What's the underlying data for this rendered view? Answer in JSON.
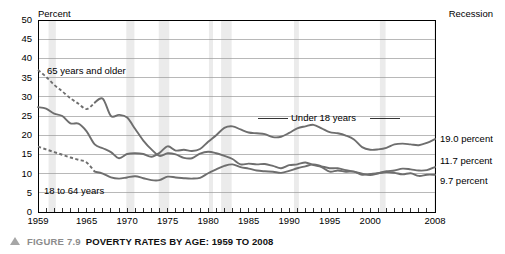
{
  "figure": {
    "caption_prefix": "FIGURE 7.9",
    "caption_title": "POVERTY RATES BY AGE: 1959 TO 2008",
    "triangle_icon": "triangle-up-icon"
  },
  "axis": {
    "y_unit_label": "Percent",
    "recession_legend": "Recession",
    "y_ticks": [
      "50",
      "45",
      "40",
      "35",
      "30",
      "25",
      "20",
      "15",
      "10",
      "5",
      "0"
    ],
    "x_ticks": [
      "1959",
      "1965",
      "1970",
      "1975",
      "1980",
      "1985",
      "1990",
      "1995",
      "2000",
      "2008"
    ]
  },
  "series_labels": {
    "under18": "Under 18 years",
    "adults": "18 to 64 years",
    "seniors": "65 years and older"
  },
  "end_labels": {
    "under18": "19.0 percent",
    "adults": "11.7 percent",
    "seniors": "9.7 percent"
  },
  "colors": {
    "line": "#6e6e6e",
    "grid": "#9a9a9a",
    "frame": "#000000",
    "recession_band": "#ebebeb",
    "caption_grey": "#8c8c8c",
    "background": "#ffffff"
  },
  "chart_data": {
    "type": "line",
    "title": "POVERTY RATES BY AGE: 1959 TO 2008",
    "xlabel": "",
    "ylabel": "Percent",
    "xlim": [
      1959,
      2008
    ],
    "ylim": [
      0,
      50
    ],
    "y_tick_step": 5,
    "grid": "horizontal",
    "legend": "inline-annotations",
    "x": [
      1959,
      1960,
      1961,
      1962,
      1963,
      1964,
      1965,
      1966,
      1967,
      1968,
      1969,
      1970,
      1971,
      1972,
      1973,
      1974,
      1975,
      1976,
      1977,
      1978,
      1979,
      1980,
      1981,
      1982,
      1983,
      1984,
      1985,
      1986,
      1987,
      1988,
      1989,
      1990,
      1991,
      1992,
      1993,
      1994,
      1995,
      1996,
      1997,
      1998,
      1999,
      2000,
      2001,
      2002,
      2003,
      2004,
      2005,
      2006,
      2007,
      2008
    ],
    "series": [
      {
        "name": "Under 18 years",
        "end_value": 19.0,
        "dashed_until": null,
        "values": [
          27.3,
          26.9,
          25.6,
          25.0,
          23.1,
          23.0,
          21.0,
          17.6,
          16.6,
          15.6,
          14.0,
          15.1,
          15.3,
          15.1,
          14.4,
          15.4,
          17.1,
          16.0,
          16.2,
          15.9,
          16.4,
          18.3,
          20.0,
          21.9,
          22.3,
          21.5,
          20.7,
          20.5,
          20.3,
          19.5,
          19.6,
          20.6,
          21.8,
          22.3,
          22.7,
          21.8,
          20.8,
          20.5,
          19.9,
          18.9,
          16.9,
          16.2,
          16.3,
          16.7,
          17.6,
          17.8,
          17.6,
          17.4,
          18.0,
          19.0
        ]
      },
      {
        "name": "18 to 64 years",
        "end_value": 11.7,
        "dashed_until": 1966,
        "values": [
          17.0,
          16.3,
          15.6,
          14.9,
          14.2,
          13.6,
          12.9,
          10.5,
          10.0,
          9.0,
          8.7,
          9.0,
          9.3,
          8.8,
          8.3,
          8.3,
          9.2,
          9.0,
          8.8,
          8.7,
          8.9,
          10.1,
          11.1,
          12.0,
          12.4,
          11.7,
          11.3,
          10.8,
          10.6,
          10.5,
          10.2,
          10.7,
          11.4,
          11.9,
          12.4,
          11.9,
          11.4,
          11.4,
          10.9,
          10.5,
          10.0,
          9.6,
          10.1,
          10.6,
          10.8,
          11.3,
          11.1,
          10.8,
          10.9,
          11.7
        ]
      },
      {
        "name": "65 years and older",
        "end_value": 9.7,
        "dashed_until": 1966,
        "values": [
          37.0,
          35.2,
          33.1,
          31.4,
          29.6,
          28.2,
          26.8,
          28.5,
          29.5,
          25.0,
          25.3,
          24.6,
          21.6,
          18.6,
          16.3,
          14.6,
          15.3,
          15.0,
          14.1,
          14.0,
          15.2,
          15.7,
          15.3,
          14.6,
          13.8,
          12.4,
          12.6,
          12.4,
          12.5,
          12.0,
          11.4,
          12.2,
          12.4,
          12.9,
          12.2,
          11.7,
          10.5,
          10.8,
          10.5,
          10.5,
          9.7,
          9.9,
          10.1,
          10.4,
          10.2,
          9.8,
          10.1,
          9.4,
          9.7,
          9.7
        ]
      }
    ],
    "recession_bands": [
      [
        1960.3,
        1961.2
      ],
      [
        1969.9,
        1970.9
      ],
      [
        1973.9,
        1975.2
      ],
      [
        1980.1,
        1980.6
      ],
      [
        1981.6,
        1982.9
      ],
      [
        1990.6,
        1991.2
      ],
      [
        2001.2,
        2001.9
      ],
      [
        2007.9,
        2008.0
      ]
    ]
  }
}
